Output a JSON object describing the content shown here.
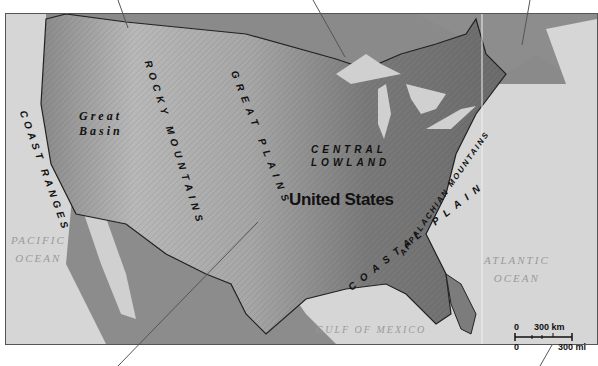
{
  "map": {
    "title": "United States",
    "regions": [
      {
        "id": "coast-ranges",
        "label": "COAST RANGES"
      },
      {
        "id": "great-basin",
        "line1": "Great",
        "line2": "Basin"
      },
      {
        "id": "rocky-mountains",
        "label": "ROCKY MOUNTAINS"
      },
      {
        "id": "great-plains",
        "label": "GREAT PLAINS"
      },
      {
        "id": "central-lowland",
        "line1": "CENTRAL",
        "line2": "LOWLAND"
      },
      {
        "id": "appalachian-mountains",
        "label": "APPALACHIAN MOUNTAINS"
      },
      {
        "id": "coastal-plain",
        "label": "COASTAL PLAIN"
      }
    ],
    "water_bodies": {
      "pacific": {
        "line1": "PACIFIC",
        "line2": "OCEAN"
      },
      "atlantic": {
        "line1": "ATLANTIC",
        "line2": "OCEAN"
      },
      "gulf": "GULF OF MEXICO"
    },
    "scale_bar": {
      "km_zero": "0",
      "km_label": "300 km",
      "mi_zero": "0",
      "mi_label": "300 mi"
    },
    "colors": {
      "water": "#d6d6d6",
      "land_dark": "#6f6f6f",
      "land_light": "#bdbdbd",
      "lakes": "#d0d0d0",
      "canada": "#8a8a8a"
    }
  }
}
